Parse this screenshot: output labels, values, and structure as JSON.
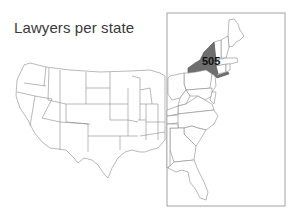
{
  "title": "Lawyers per state",
  "map": {
    "region": "United States (contiguous)",
    "inset": "Eastern US zoom",
    "highlighted_state": "New York",
    "highlight_color": "#6e6e6e",
    "value_label": "505"
  }
}
